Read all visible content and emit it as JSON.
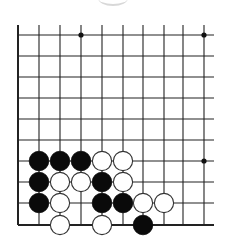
{
  "board": {
    "type": "go-diagram",
    "columns": 10,
    "rows": 10,
    "col_x": [
      18,
      39,
      60,
      81,
      102,
      123,
      143,
      164,
      183,
      204
    ],
    "row_y": [
      35,
      56,
      77,
      98,
      119,
      140,
      161,
      182,
      203,
      225
    ],
    "open_top": true,
    "open_right": true,
    "left_edge": true,
    "bottom_edge": true,
    "line_color": "#222222",
    "star_points": [
      {
        "col": 3,
        "row": 0
      },
      {
        "col": 9,
        "row": 0
      },
      {
        "col": 9,
        "row": 6
      }
    ],
    "stones": [
      {
        "color": "black",
        "col": 1,
        "row": 6
      },
      {
        "color": "black",
        "col": 2,
        "row": 6
      },
      {
        "color": "black",
        "col": 3,
        "row": 6
      },
      {
        "color": "white",
        "col": 4,
        "row": 6
      },
      {
        "color": "white",
        "col": 5,
        "row": 6
      },
      {
        "color": "black",
        "col": 1,
        "row": 7
      },
      {
        "color": "white",
        "col": 2,
        "row": 7
      },
      {
        "color": "white",
        "col": 3,
        "row": 7
      },
      {
        "color": "black",
        "col": 4,
        "row": 7
      },
      {
        "color": "white",
        "col": 5,
        "row": 7
      },
      {
        "color": "black",
        "col": 1,
        "row": 8
      },
      {
        "color": "white",
        "col": 2,
        "row": 8
      },
      {
        "color": "black",
        "col": 4,
        "row": 8
      },
      {
        "color": "black",
        "col": 5,
        "row": 8
      },
      {
        "color": "white",
        "col": 6,
        "row": 8
      },
      {
        "color": "white",
        "col": 7,
        "row": 8
      },
      {
        "color": "white",
        "col": 2,
        "row": 9
      },
      {
        "color": "white",
        "col": 4,
        "row": 9
      },
      {
        "color": "black",
        "col": 6,
        "row": 9
      }
    ]
  }
}
